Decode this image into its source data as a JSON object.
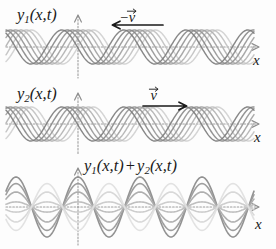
{
  "figure": {
    "title_semantic": "standing-wave-superposition",
    "background_color": "#fdfdfd",
    "axis_color": "#8e8e8e",
    "text_color": "#1a1a1a"
  },
  "panels": [
    {
      "id": "panel-1",
      "label": {
        "y": "y",
        "sub": "1",
        "args": "(x,t)"
      },
      "velocity": {
        "minus": "−",
        "symbol": "v",
        "direction": "left",
        "arrow_glyph": "←"
      },
      "axis_x_label": "x",
      "wave": {
        "kind": "traveling",
        "direction": "left",
        "snapshots": 7
      }
    },
    {
      "id": "panel-2",
      "label": {
        "y": "y",
        "sub": "2",
        "args": "(x,t)"
      },
      "velocity": {
        "minus": "",
        "symbol": "v",
        "direction": "right",
        "arrow_glyph": "→"
      },
      "axis_x_label": "x",
      "wave": {
        "kind": "traveling",
        "direction": "right",
        "snapshots": 7
      }
    },
    {
      "id": "panel-3",
      "label": {
        "y1": "y",
        "sub1": "1",
        "args1": "(x,t)",
        "plus": "+",
        "y2": "y",
        "sub2": "2",
        "args2": "(x,t)"
      },
      "axis_x_label": "x",
      "wave": {
        "kind": "standing",
        "direction": "none",
        "snapshots": 7
      }
    }
  ],
  "chart_data": {
    "type": "line",
    "xlabel": "x",
    "ylabel": "y",
    "grid": false,
    "legend": false,
    "x_range_label": "x",
    "wave_parameters": {
      "wavelength_px": 62,
      "amplitude_px": 18,
      "snapshot_count": 7,
      "phase_step_fraction_of_period": 0.1667
    },
    "subplots": [
      {
        "name": "y1(x,t)",
        "type": "traveling-wave",
        "propagation": "-v (leftward)",
        "equation": "y1 = A sin(kx + wt)",
        "amplitude": 1.0,
        "series": [
          {
            "name": "t0",
            "phase": 0.0,
            "gray": "#cfcfcf"
          },
          {
            "name": "t1",
            "phase": 0.17,
            "gray": "#c0c0c0"
          },
          {
            "name": "t2",
            "phase": 0.34,
            "gray": "#b0b0b0"
          },
          {
            "name": "t3",
            "phase": 0.51,
            "gray": "#a0a0a0"
          },
          {
            "name": "t4",
            "phase": 0.68,
            "gray": "#949494"
          },
          {
            "name": "t5",
            "phase": 0.85,
            "gray": "#878787"
          },
          {
            "name": "t6",
            "phase": 1.02,
            "gray": "#7b7b7b"
          }
        ]
      },
      {
        "name": "y2(x,t)",
        "type": "traveling-wave",
        "propagation": "+v (rightward)",
        "equation": "y2 = A sin(kx - wt)",
        "amplitude": 1.0,
        "series": [
          {
            "name": "t0",
            "phase": 0.0,
            "gray": "#cfcfcf"
          },
          {
            "name": "t1",
            "phase": -0.17,
            "gray": "#c0c0c0"
          },
          {
            "name": "t2",
            "phase": -0.34,
            "gray": "#b0b0b0"
          },
          {
            "name": "t3",
            "phase": -0.51,
            "gray": "#a0a0a0"
          },
          {
            "name": "t4",
            "phase": -0.68,
            "gray": "#949494"
          },
          {
            "name": "t5",
            "phase": -0.85,
            "gray": "#878787"
          },
          {
            "name": "t6",
            "phase": -1.02,
            "gray": "#7b7b7b"
          }
        ]
      },
      {
        "name": "y1(x,t) + y2(x,t)",
        "type": "standing-wave",
        "propagation": "none (nodes fixed)",
        "equation": "y = 2A sin(kx) cos(wt)",
        "amplitude": 2.0,
        "series": [
          {
            "name": "t0",
            "envelope_scale": 1.0,
            "gray": "#8c8c8c"
          },
          {
            "name": "t1",
            "envelope_scale": 0.78,
            "gray": "#9a9a9a"
          },
          {
            "name": "t2",
            "envelope_scale": 0.5,
            "gray": "#ababab"
          },
          {
            "name": "t3",
            "envelope_scale": 0.17,
            "gray": "#bcbcbc"
          },
          {
            "name": "t4",
            "envelope_scale": -0.17,
            "gray": "#cacaca"
          },
          {
            "name": "t5",
            "envelope_scale": -0.5,
            "gray": "#d6d6d6"
          },
          {
            "name": "t6",
            "envelope_scale": -0.78,
            "gray": "#e0e0e0"
          }
        ]
      }
    ]
  }
}
